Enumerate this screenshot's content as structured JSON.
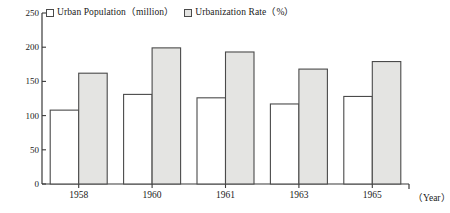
{
  "chart_data": {
    "type": "bar",
    "title": "",
    "xlabel": "（Year）",
    "ylabel": "",
    "categories": [
      "1958",
      "1960",
      "1961",
      "1963",
      "1965"
    ],
    "series": [
      {
        "name": "Urban Population（million）",
        "swatch": "empty",
        "values": [
          108,
          131,
          126,
          117,
          128
        ]
      },
      {
        "name": "Urbanization Rate（%）",
        "swatch": "filled",
        "values": [
          162,
          199,
          193,
          168,
          179
        ]
      }
    ],
    "ylim": [
      0,
      250
    ],
    "yticks": [
      0,
      50,
      100,
      150,
      200,
      250
    ],
    "ytick_labels": [
      "0",
      "50",
      "100",
      "150",
      "200",
      "250"
    ],
    "grid": false,
    "legend_position": "top-left",
    "colors": {
      "bar_fill_series1": "#ffffff",
      "bar_fill_series2": "#e4e4e2",
      "bar_stroke": "#4a4a4a",
      "axis": "#3a3a3a",
      "text": "#1a1a1a",
      "background": "#ffffff"
    }
  }
}
